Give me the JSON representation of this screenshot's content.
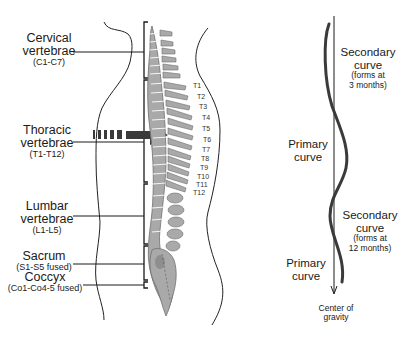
{
  "diagram": {
    "left_panel": {
      "regions": [
        {
          "name": "Cervical",
          "line2": "vertebrae",
          "range": "(C1-C7)"
        },
        {
          "name": "Thoracic",
          "line2": "vertebrae",
          "range": "(T1-T12)"
        },
        {
          "name": "Lumbar",
          "line2": "vertebrae",
          "range": "(L1-L5)"
        },
        {
          "name": "Sacrum",
          "range": "(S1-S5 fused)"
        },
        {
          "name": "Coccyx",
          "range": "(Co1-Co4-5 fused)"
        }
      ],
      "thoracic_labels": [
        "T1",
        "T2",
        "T3",
        "T4",
        "T5",
        "T6",
        "T7",
        "T8",
        "T9",
        "T10",
        "T11",
        "T12"
      ]
    },
    "right_panel": {
      "secondary_upper": {
        "title": "Secondary",
        "line2": "curve",
        "note1": "(forms at",
        "note2": "3 months)"
      },
      "primary_upper": {
        "title": "Primary",
        "line2": "curve"
      },
      "secondary_lower": {
        "title": "Secondary",
        "line2": "curve",
        "note1": "(forms at",
        "note2": "12 months)"
      },
      "primary_lower": {
        "title": "Primary",
        "line2": "curve"
      },
      "gravity": {
        "line1": "Center of",
        "line2": "gravity"
      }
    },
    "colors": {
      "bone": "#a9a9a9",
      "bone_dark": "#6e6e6e",
      "line": "#1a1a1a",
      "arrow": "#3a3a3a"
    }
  }
}
